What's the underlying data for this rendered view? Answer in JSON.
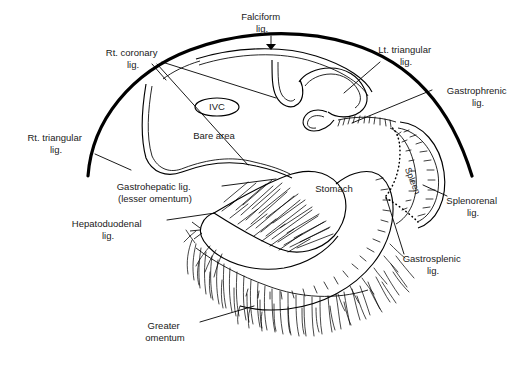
{
  "figure": {
    "type": "anatomical-diagram",
    "background_color": "#ffffff",
    "ink_color": "#000000"
  },
  "labels": [
    {
      "id": "falciform",
      "text_lines": [
        "Falciform",
        "lig."
      ],
      "x": 262,
      "y": 20,
      "align": "middle"
    },
    {
      "id": "rt_coronary",
      "text_lines": [
        "Rt. coronary",
        "lig."
      ],
      "x": 133,
      "y": 56,
      "align": "middle"
    },
    {
      "id": "lt_triangular",
      "text_lines": [
        "Lt. triangular",
        "lig."
      ],
      "x": 406,
      "y": 53,
      "align": "middle"
    },
    {
      "id": "gastrophrenic",
      "text_lines": [
        "Gastrophrenic",
        "lig."
      ],
      "x": 478,
      "y": 94,
      "align": "middle"
    },
    {
      "id": "ivc",
      "text_lines": [
        "IVC"
      ],
      "x": 217,
      "y": 110,
      "align": "middle"
    },
    {
      "id": "bare_area",
      "text_lines": [
        "Bare area"
      ],
      "x": 214,
      "y": 139,
      "align": "middle"
    },
    {
      "id": "rt_triangular",
      "text_lines": [
        "Rt. triangular",
        "lig."
      ],
      "x": 56,
      "y": 141,
      "align": "middle"
    },
    {
      "id": "gastrohepatic",
      "text_lines": [
        "Gastrohepatic lig.",
        "(lesser omentum)"
      ],
      "x": 155,
      "y": 190,
      "align": "middle"
    },
    {
      "id": "spleen",
      "text_lines": [
        "Spleen"
      ],
      "x": 410,
      "y": 182,
      "align": "middle"
    },
    {
      "id": "stomach",
      "text_lines": [
        "Stomach"
      ],
      "x": 334,
      "y": 192,
      "align": "middle"
    },
    {
      "id": "splenorenal",
      "text_lines": [
        "Splenorenal",
        "lig."
      ],
      "x": 473,
      "y": 204,
      "align": "middle"
    },
    {
      "id": "hepatoduodenal",
      "text_lines": [
        "Hepatoduodenal",
        "lig."
      ],
      "x": 108,
      "y": 227,
      "align": "middle"
    },
    {
      "id": "gastrosplenic",
      "text_lines": [
        "Gastrosplenic",
        "lig."
      ],
      "x": 433,
      "y": 262,
      "align": "middle"
    },
    {
      "id": "greater_omentum",
      "text_lines": [
        "Greater",
        "omentum"
      ],
      "x": 165,
      "y": 329,
      "align": "middle"
    }
  ],
  "leader_lines": [
    {
      "id": "falciform-leader",
      "path": "M 271 36 L 271 48"
    },
    {
      "id": "rt-coronary-leader-a",
      "path": "M 152 64 L 165 78"
    },
    {
      "id": "rt-coronary-leader-b",
      "path": "M 158 64 L 248 165"
    },
    {
      "id": "rt-coronary-leader-c",
      "path": "M 162 62 L 275 97"
    },
    {
      "id": "lt-triangular-leader",
      "path": "M 380 62 L 345 92"
    },
    {
      "id": "gastrophrenic-leader",
      "path": "M 432 90 L 352 123"
    },
    {
      "id": "rt-triangular-leader",
      "path": "M 95 154 L 130 169"
    },
    {
      "id": "gastrohepatic-leader",
      "path": "M 222 186 L 275 179"
    },
    {
      "id": "hepatoduodenal-leader",
      "path": "M 167 220 L 214 213"
    },
    {
      "id": "splenorenal-leader",
      "path": "M 447 196 L 424 186"
    },
    {
      "id": "gastrosplenic-leader",
      "path": "M 404 254 L 386 196"
    },
    {
      "id": "greater-omentum-leader",
      "path": "M 200 322 L 253 306"
    }
  ]
}
